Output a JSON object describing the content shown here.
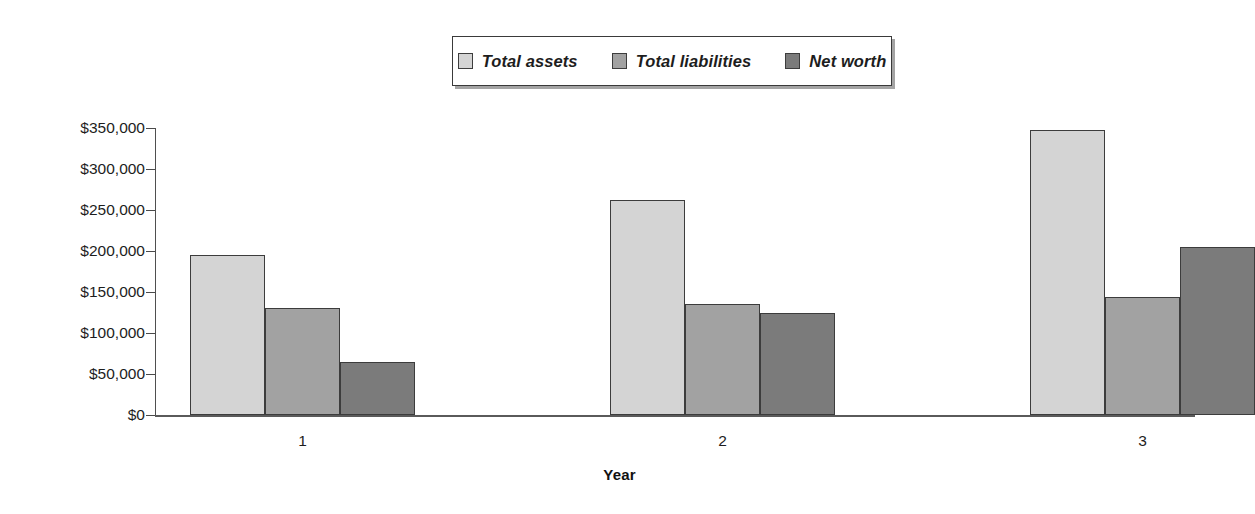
{
  "chart_data": {
    "type": "bar",
    "title": "",
    "subtitle": "",
    "xlabel": "Year",
    "ylabel": "",
    "categories": [
      "1",
      "2",
      "3"
    ],
    "series": [
      {
        "name": "Total assets",
        "values": [
          195000,
          262000,
          348000
        ],
        "color": "#d4d4d4"
      },
      {
        "name": "Total liabilities",
        "values": [
          130000,
          135000,
          144000
        ],
        "color": "#a2a2a2"
      },
      {
        "name": "Net worth",
        "values": [
          65000,
          125000,
          205000
        ],
        "color": "#7b7b7b"
      }
    ],
    "ylim": [
      0,
      350000
    ],
    "ytick_values": [
      0,
      50000,
      100000,
      150000,
      200000,
      250000,
      300000,
      350000
    ],
    "ytick_labels": [
      "$0",
      "$50,000",
      "$100,000",
      "$150,000",
      "$200,000",
      "$250,000",
      "$300,000",
      "$350,000"
    ],
    "grid": false,
    "legend_position": "top-center",
    "legend_boxed": true
  },
  "axis": {
    "x_title": "Year"
  },
  "legend": {
    "items": [
      {
        "label": "Total assets",
        "color": "#d4d4d4"
      },
      {
        "label": "Total liabilities",
        "color": "#a2a2a2"
      },
      {
        "label": "Net worth",
        "color": "#7b7b7b"
      }
    ]
  }
}
